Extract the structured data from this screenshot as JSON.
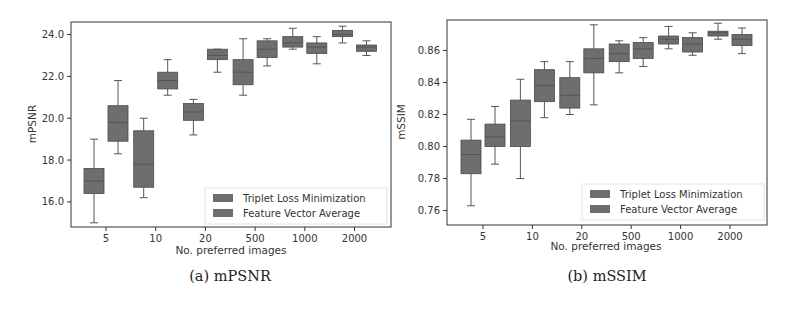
{
  "captions": {
    "left": "(a) mPSNR",
    "right": "(b) mSSIM"
  },
  "colors": {
    "box": "#6e6e6e",
    "box_edge": "#4a4a4a",
    "whisker": "#555555",
    "frame": "#333333"
  },
  "chart_data": [
    {
      "type": "box",
      "title": "(a) mPSNR",
      "xlabel": "No. preferred images",
      "ylabel": "mPSNR",
      "categories": [
        "5",
        "10",
        "20",
        "500",
        "1000",
        "2000"
      ],
      "yticks": [
        "16.0",
        "18.0",
        "20.0",
        "22.0",
        "24.0"
      ],
      "ylim": [
        14.8,
        24.6
      ],
      "legend": {
        "position": "lower right",
        "entries": [
          "Triplet Loss Minimization",
          "Feature Vector Average"
        ]
      },
      "series": [
        {
          "name": "Triplet Loss Minimization",
          "boxes": [
            {
              "min": 15.0,
              "q1": 16.4,
              "median": 17.0,
              "q3": 17.6,
              "max": 19.0
            },
            {
              "min": 16.2,
              "q1": 16.7,
              "median": 17.8,
              "q3": 19.4,
              "max": 20.0
            },
            {
              "min": 19.2,
              "q1": 19.9,
              "median": 20.3,
              "q3": 20.7,
              "max": 20.9
            },
            {
              "min": 21.1,
              "q1": 21.6,
              "median": 22.2,
              "q3": 22.8,
              "max": 23.8
            },
            {
              "min": 23.3,
              "q1": 23.4,
              "median": 23.6,
              "q3": 23.9,
              "max": 24.3
            },
            {
              "min": 23.6,
              "q1": 23.9,
              "median": 24.0,
              "q3": 24.2,
              "max": 24.4
            }
          ]
        },
        {
          "name": "Feature Vector Average",
          "boxes": [
            {
              "min": 18.3,
              "q1": 18.9,
              "median": 19.8,
              "q3": 20.6,
              "max": 21.8
            },
            {
              "min": 21.1,
              "q1": 21.4,
              "median": 21.8,
              "q3": 22.2,
              "max": 22.8
            },
            {
              "min": 22.2,
              "q1": 22.8,
              "median": 23.0,
              "q3": 23.3,
              "max": 23.3
            },
            {
              "min": 22.5,
              "q1": 22.9,
              "median": 23.3,
              "q3": 23.7,
              "max": 23.8
            },
            {
              "min": 22.6,
              "q1": 23.1,
              "median": 23.4,
              "q3": 23.6,
              "max": 23.9
            },
            {
              "min": 23.0,
              "q1": 23.2,
              "median": 23.4,
              "q3": 23.5,
              "max": 23.7
            }
          ]
        }
      ]
    },
    {
      "type": "box",
      "title": "(b) mSSIM",
      "xlabel": "No. preferred images",
      "ylabel": "mSSIM",
      "categories": [
        "5",
        "10",
        "20",
        "500",
        "1000",
        "2000"
      ],
      "yticks": [
        "0.76",
        "0.78",
        "0.80",
        "0.82",
        "0.84",
        "0.86"
      ],
      "ylim": [
        0.751,
        0.879
      ],
      "legend": {
        "position": "lower right",
        "entries": [
          "Triplet Loss Minimization",
          "Feature Vector Average"
        ]
      },
      "series": [
        {
          "name": "Triplet Loss Minimization",
          "boxes": [
            {
              "min": 0.763,
              "q1": 0.783,
              "median": 0.795,
              "q3": 0.804,
              "max": 0.817
            },
            {
              "min": 0.78,
              "q1": 0.8,
              "median": 0.816,
              "q3": 0.829,
              "max": 0.842
            },
            {
              "min": 0.82,
              "q1": 0.824,
              "median": 0.832,
              "q3": 0.843,
              "max": 0.853
            },
            {
              "min": 0.846,
              "q1": 0.853,
              "median": 0.858,
              "q3": 0.864,
              "max": 0.866
            },
            {
              "min": 0.861,
              "q1": 0.864,
              "median": 0.867,
              "q3": 0.869,
              "max": 0.875
            },
            {
              "min": 0.867,
              "q1": 0.869,
              "median": 0.871,
              "q3": 0.872,
              "max": 0.877
            }
          ]
        },
        {
          "name": "Feature Vector Average",
          "boxes": [
            {
              "min": 0.789,
              "q1": 0.8,
              "median": 0.806,
              "q3": 0.814,
              "max": 0.825
            },
            {
              "min": 0.818,
              "q1": 0.828,
              "median": 0.838,
              "q3": 0.848,
              "max": 0.853
            },
            {
              "min": 0.826,
              "q1": 0.846,
              "median": 0.855,
              "q3": 0.861,
              "max": 0.876
            },
            {
              "min": 0.85,
              "q1": 0.855,
              "median": 0.861,
              "q3": 0.865,
              "max": 0.868
            },
            {
              "min": 0.857,
              "q1": 0.859,
              "median": 0.864,
              "q3": 0.868,
              "max": 0.871
            },
            {
              "min": 0.858,
              "q1": 0.863,
              "median": 0.867,
              "q3": 0.87,
              "max": 0.874
            }
          ]
        }
      ]
    }
  ]
}
